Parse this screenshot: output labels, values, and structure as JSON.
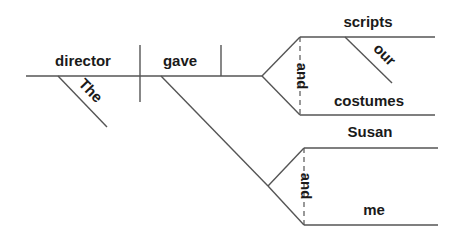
{
  "diagram": {
    "type": "sentence-diagram",
    "sentence": "The director gave our scripts and costumes to Susan and me",
    "subject": {
      "word": "director",
      "modifier": "The"
    },
    "verb": {
      "word": "gave"
    },
    "direct_objects": {
      "conjunction": "and",
      "items": [
        {
          "word": "scripts",
          "modifier": "our"
        },
        {
          "word": "costumes"
        }
      ]
    },
    "indirect_objects": {
      "conjunction": "and",
      "items": [
        {
          "word": "Susan"
        },
        {
          "word": "me"
        }
      ]
    },
    "colors": {
      "line": "#555555",
      "text": "#1a1a1a",
      "background": "#ffffff"
    }
  }
}
